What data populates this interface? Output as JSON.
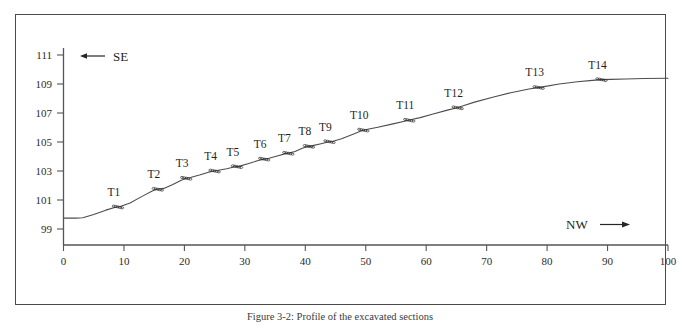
{
  "figure": {
    "caption": "Figure 3-2: Profile of the excavated sections"
  },
  "annotations": {
    "se_label": "SE",
    "nw_label": "NW",
    "se_arrow_icon": "arrow-left-icon",
    "nw_arrow_icon": "arrow-right-icon"
  },
  "chart_data": {
    "type": "line",
    "title": "",
    "xlabel": "",
    "ylabel": "",
    "xlim": [
      0,
      100
    ],
    "ylim": [
      98,
      112
    ],
    "grid": false,
    "legend": "none",
    "xticks": [
      0,
      10,
      20,
      30,
      40,
      50,
      60,
      70,
      80,
      90,
      100
    ],
    "xticklabels": [
      "0",
      "10",
      "20",
      "30",
      "40",
      "50",
      "60",
      "70",
      "80",
      "90",
      "100"
    ],
    "yticks": [
      99,
      101,
      103,
      105,
      107,
      109,
      111
    ],
    "yticklabels": [
      "99",
      "101",
      "103",
      "105",
      "107",
      "109",
      "111"
    ],
    "series": [
      {
        "name": "ground-profile",
        "x": [
          0,
          2.0,
          3.2,
          5.0,
          7.0,
          8.6,
          9.4,
          11.0,
          13.0,
          14.6,
          15.3,
          16.0,
          16.6,
          18.0,
          19.4,
          20.3,
          21.0,
          22.5,
          24.0,
          24.9,
          25.6,
          27.0,
          28.2,
          29.0,
          30.5,
          32.2,
          33.2,
          34.0,
          35.5,
          36.6,
          37.4,
          38.3,
          39.6,
          40.4,
          41.2,
          42.6,
          43.8,
          44.6,
          46.0,
          48.0,
          49.3,
          50.3,
          52.0,
          54.5,
          56.6,
          57.6,
          59.0,
          61.0,
          63.5,
          65.0,
          66.0,
          68.0,
          71.0,
          74.0,
          77.0,
          78.5,
          79.5,
          82.0,
          85.0,
          87.5,
          89.0,
          90.5,
          93.0,
          96.0,
          100.0
        ],
        "y": [
          99.75,
          99.75,
          99.78,
          100.0,
          100.3,
          100.5,
          100.55,
          100.8,
          101.25,
          101.6,
          101.72,
          101.78,
          101.8,
          102.05,
          102.35,
          102.5,
          102.55,
          102.72,
          102.92,
          103.0,
          103.05,
          103.15,
          103.28,
          103.32,
          103.5,
          103.72,
          103.82,
          103.88,
          104.05,
          104.18,
          104.25,
          104.35,
          104.58,
          104.68,
          104.75,
          104.88,
          105.0,
          105.05,
          105.22,
          105.55,
          105.78,
          105.88,
          106.02,
          106.25,
          106.45,
          106.55,
          106.68,
          106.92,
          107.2,
          107.35,
          107.48,
          107.75,
          108.08,
          108.4,
          108.65,
          108.75,
          108.82,
          109.0,
          109.15,
          109.25,
          109.3,
          109.32,
          109.35,
          109.38,
          109.4
        ]
      }
    ],
    "annotated_points": [
      {
        "label": "T1",
        "x": 9.0,
        "y": 100.52
      },
      {
        "label": "T2",
        "x": 15.6,
        "y": 101.74
      },
      {
        "label": "T3",
        "x": 20.3,
        "y": 102.5
      },
      {
        "label": "T4",
        "x": 25.0,
        "y": 103.0
      },
      {
        "label": "T5",
        "x": 28.7,
        "y": 103.3
      },
      {
        "label": "T6",
        "x": 33.2,
        "y": 103.82
      },
      {
        "label": "T7",
        "x": 37.2,
        "y": 104.22
      },
      {
        "label": "T8",
        "x": 40.6,
        "y": 104.7
      },
      {
        "label": "T9",
        "x": 44.0,
        "y": 105.02
      },
      {
        "label": "T10",
        "x": 49.6,
        "y": 105.82
      },
      {
        "label": "T11",
        "x": 57.2,
        "y": 106.5
      },
      {
        "label": "T12",
        "x": 65.2,
        "y": 107.36
      },
      {
        "label": "T13",
        "x": 78.6,
        "y": 108.76
      },
      {
        "label": "T14",
        "x": 89.0,
        "y": 109.3
      }
    ]
  }
}
